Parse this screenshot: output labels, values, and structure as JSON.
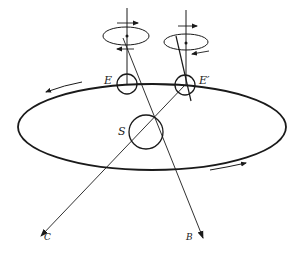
{
  "figure": {
    "labels": {
      "earth_left": "E",
      "earth_right": "E′",
      "sun": "S",
      "direction_c": "C",
      "direction_b": "B"
    },
    "colors": {
      "stroke": "#1a1a1a",
      "background": "#ffffff"
    }
  }
}
